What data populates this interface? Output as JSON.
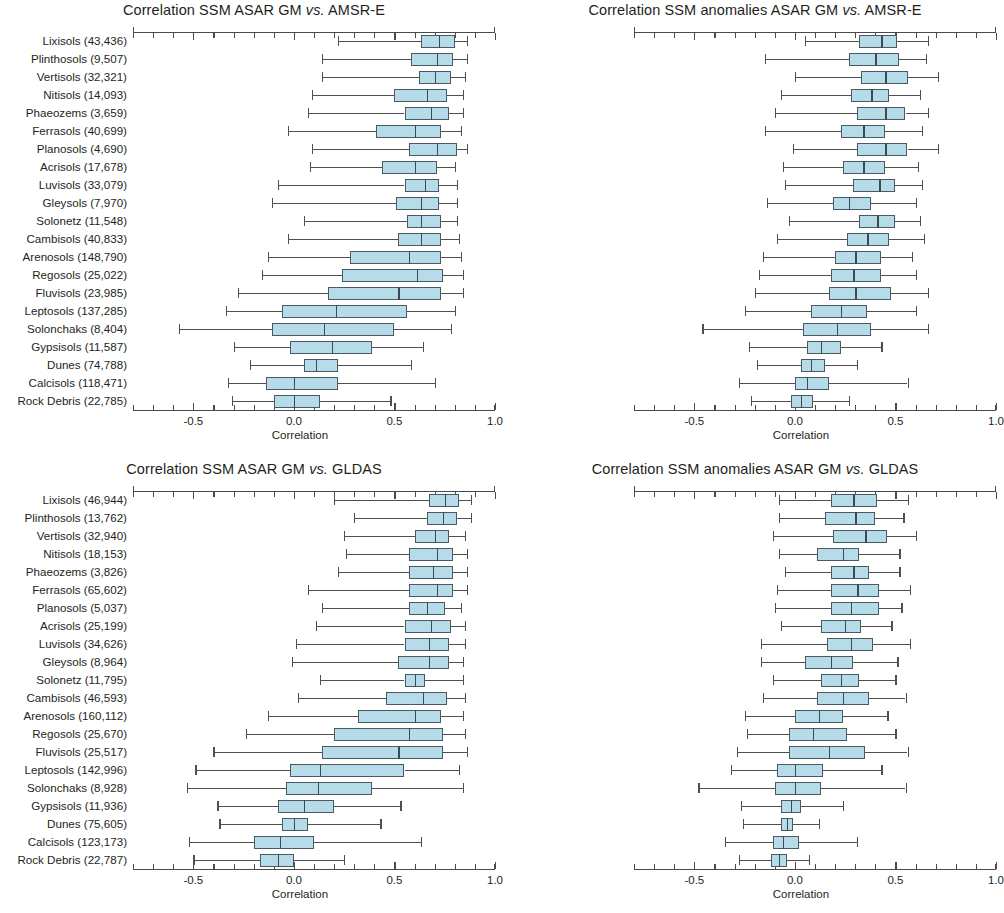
{
  "figure": {
    "width": 996,
    "height": 913,
    "box_fill_color": "#b6dcea",
    "box_line_color": "#4a5a63",
    "whisker_color": "#4f4f4f",
    "axis_color": "#4a4a4a",
    "text_color": "#231f20"
  },
  "axis": {
    "xlabel": "Correlation",
    "xlim": [
      -0.8,
      1.0
    ],
    "tick_labels": [
      "-0.5",
      "0.0",
      "0.5",
      "1.0"
    ],
    "tick_values": [
      -0.5,
      0.0,
      0.5,
      1.0
    ],
    "minor_tick_step": 0.1
  },
  "chart_data": [
    {
      "type": "box",
      "panel": "top-left",
      "title_parts": {
        "pre": "Correlation SSM ASAR GM ",
        "italic": "vs.",
        "post": " AMSR-E"
      },
      "title": "Correlation SSM ASAR GM vs. AMSR-E",
      "xlabel": "Correlation",
      "ylabel": "",
      "xlim": [
        -0.8,
        1.0
      ],
      "grid": false,
      "legend": "none",
      "categories": [
        "Lixisols (43,436)",
        "Plinthosols (9,507)",
        "Vertisols (32,321)",
        "Nitisols (14,093)",
        "Phaeozems (3,659)",
        "Ferrasols (40,699)",
        "Planosols (4,690)",
        "Acrisols (17,678)",
        "Luvisols (33,079)",
        "Gleysols (7,970)",
        "Solonetz (11,548)",
        "Cambisols (40,833)",
        "Arenosols (148,790)",
        "Regosols (25,022)",
        "Fluvisols (23,985)",
        "Leptosols (137,285)",
        "Solonchaks (8,404)",
        "Gypsisols (11,587)",
        "Dunes (74,788)",
        "Calcisols (118,471)",
        "Rock Debris (22,785)"
      ],
      "boxes": [
        {
          "low": 0.22,
          "q1": 0.63,
          "med": 0.72,
          "q3": 0.8,
          "high": 0.86
        },
        {
          "low": 0.14,
          "q1": 0.58,
          "med": 0.71,
          "q3": 0.79,
          "high": 0.86
        },
        {
          "low": 0.14,
          "q1": 0.62,
          "med": 0.7,
          "q3": 0.78,
          "high": 0.85
        },
        {
          "low": 0.09,
          "q1": 0.5,
          "med": 0.66,
          "q3": 0.76,
          "high": 0.84
        },
        {
          "low": 0.07,
          "q1": 0.55,
          "med": 0.68,
          "q3": 0.77,
          "high": 0.84
        },
        {
          "low": -0.03,
          "q1": 0.41,
          "med": 0.6,
          "q3": 0.73,
          "high": 0.83
        },
        {
          "low": 0.09,
          "q1": 0.57,
          "med": 0.71,
          "q3": 0.81,
          "high": 0.86
        },
        {
          "low": 0.08,
          "q1": 0.44,
          "med": 0.6,
          "q3": 0.71,
          "high": 0.8
        },
        {
          "low": -0.08,
          "q1": 0.55,
          "med": 0.65,
          "q3": 0.72,
          "high": 0.81
        },
        {
          "low": -0.11,
          "q1": 0.51,
          "med": 0.63,
          "q3": 0.72,
          "high": 0.81
        },
        {
          "low": 0.05,
          "q1": 0.56,
          "med": 0.63,
          "q3": 0.73,
          "high": 0.81
        },
        {
          "low": -0.03,
          "q1": 0.52,
          "med": 0.63,
          "q3": 0.73,
          "high": 0.82
        },
        {
          "low": -0.13,
          "q1": 0.28,
          "med": 0.57,
          "q3": 0.73,
          "high": 0.83
        },
        {
          "low": -0.16,
          "q1": 0.24,
          "med": 0.61,
          "q3": 0.74,
          "high": 0.84
        },
        {
          "low": -0.28,
          "q1": 0.17,
          "med": 0.52,
          "q3": 0.73,
          "high": 0.84
        },
        {
          "low": -0.34,
          "q1": -0.06,
          "med": 0.21,
          "q3": 0.56,
          "high": 0.8
        },
        {
          "low": -0.57,
          "q1": -0.11,
          "med": 0.15,
          "q3": 0.5,
          "high": 0.78
        },
        {
          "low": -0.3,
          "q1": -0.02,
          "med": 0.19,
          "q3": 0.39,
          "high": 0.64
        },
        {
          "low": -0.22,
          "q1": 0.05,
          "med": 0.11,
          "q3": 0.22,
          "high": 0.58
        },
        {
          "low": -0.33,
          "q1": -0.14,
          "med": 0.0,
          "q3": 0.22,
          "high": 0.7
        },
        {
          "low": -0.31,
          "q1": -0.1,
          "med": 0.0,
          "q3": 0.13,
          "high": 0.48
        }
      ]
    },
    {
      "type": "box",
      "panel": "top-right",
      "title_parts": {
        "pre": "Correlation SSM anomalies ASAR GM ",
        "italic": "vs.",
        "post": " AMSR-E"
      },
      "title": "Correlation SSM anomalies ASAR GM vs. AMSR-E",
      "xlabel": "Correlation",
      "ylabel": "",
      "xlim": [
        -0.8,
        1.0
      ],
      "grid": false,
      "legend": "none",
      "categories": [
        "Lixisols (43,436)",
        "Plinthosols (9,507)",
        "Vertisols (32,321)",
        "Nitisols (14,093)",
        "Phaeozems (3,659)",
        "Ferrasols (40,699)",
        "Planosols (4,690)",
        "Acrisols (17,678)",
        "Luvisols (33,079)",
        "Gleysols (7,970)",
        "Solonetz (11,548)",
        "Cambisols (40,833)",
        "Arenosols (148,790)",
        "Regosols (25,022)",
        "Fluvisols (23,985)",
        "Leptosols (137,285)",
        "Solonchaks (8,404)",
        "Gypsisols (11,587)",
        "Dunes (74,788)",
        "Calcisols (118,471)",
        "Rock Debris (22,785)"
      ],
      "boxes": [
        {
          "low": 0.05,
          "q1": 0.32,
          "med": 0.43,
          "q3": 0.51,
          "high": 0.66
        },
        {
          "low": -0.15,
          "q1": 0.27,
          "med": 0.4,
          "q3": 0.52,
          "high": 0.65
        },
        {
          "low": 0.0,
          "q1": 0.33,
          "med": 0.45,
          "q3": 0.56,
          "high": 0.71
        },
        {
          "low": -0.07,
          "q1": 0.28,
          "med": 0.38,
          "q3": 0.47,
          "high": 0.62
        },
        {
          "low": -0.1,
          "q1": 0.31,
          "med": 0.45,
          "q3": 0.55,
          "high": 0.66
        },
        {
          "low": -0.15,
          "q1": 0.23,
          "med": 0.34,
          "q3": 0.45,
          "high": 0.63
        },
        {
          "low": -0.01,
          "q1": 0.31,
          "med": 0.45,
          "q3": 0.56,
          "high": 0.71
        },
        {
          "low": -0.06,
          "q1": 0.24,
          "med": 0.34,
          "q3": 0.45,
          "high": 0.61
        },
        {
          "low": -0.05,
          "q1": 0.29,
          "med": 0.42,
          "q3": 0.5,
          "high": 0.63
        },
        {
          "low": -0.14,
          "q1": 0.19,
          "med": 0.27,
          "q3": 0.38,
          "high": 0.6
        },
        {
          "low": -0.03,
          "q1": 0.32,
          "med": 0.41,
          "q3": 0.5,
          "high": 0.62
        },
        {
          "low": -0.09,
          "q1": 0.26,
          "med": 0.36,
          "q3": 0.47,
          "high": 0.64
        },
        {
          "low": -0.16,
          "q1": 0.2,
          "med": 0.3,
          "q3": 0.43,
          "high": 0.58
        },
        {
          "low": -0.18,
          "q1": 0.18,
          "med": 0.29,
          "q3": 0.43,
          "high": 0.6
        },
        {
          "low": -0.2,
          "q1": 0.17,
          "med": 0.3,
          "q3": 0.48,
          "high": 0.66
        },
        {
          "low": -0.25,
          "q1": 0.08,
          "med": 0.23,
          "q3": 0.36,
          "high": 0.6
        },
        {
          "low": -0.46,
          "q1": 0.04,
          "med": 0.21,
          "q3": 0.38,
          "high": 0.66
        },
        {
          "low": -0.23,
          "q1": 0.06,
          "med": 0.13,
          "q3": 0.23,
          "high": 0.43
        },
        {
          "low": -0.19,
          "q1": 0.03,
          "med": 0.08,
          "q3": 0.15,
          "high": 0.31
        },
        {
          "low": -0.28,
          "q1": 0.0,
          "med": 0.06,
          "q3": 0.17,
          "high": 0.56
        },
        {
          "low": -0.22,
          "q1": -0.02,
          "med": 0.03,
          "q3": 0.09,
          "high": 0.27
        }
      ]
    },
    {
      "type": "box",
      "panel": "bottom-left",
      "title_parts": {
        "pre": "Correlation SSM ASAR GM ",
        "italic": "vs.",
        "post": " GLDAS"
      },
      "title": "Correlation SSM ASAR GM vs. GLDAS",
      "xlabel": "Correlation",
      "ylabel": "",
      "xlim": [
        -0.8,
        1.0
      ],
      "grid": false,
      "legend": "none",
      "categories": [
        "Lixisols (46,944)",
        "Plinthosols (13,762)",
        "Vertisols (32,940)",
        "Nitisols (18,153)",
        "Phaeozems (3,826)",
        "Ferrasols (65,602)",
        "Planosols (5,037)",
        "Acrisols (25,199)",
        "Luvisols (34,626)",
        "Gleysols (8,964)",
        "Solonetz (11,795)",
        "Cambisols (46,593)",
        "Arenosols (160,112)",
        "Regosols (25,670)",
        "Fluvisols (25,517)",
        "Leptosols (142,996)",
        "Solonchaks (8,928)",
        "Gypsisols (11,936)",
        "Dunes (75,605)",
        "Calcisols (123,173)",
        "Rock Debris (22,787)"
      ],
      "boxes": [
        {
          "low": 0.2,
          "q1": 0.67,
          "med": 0.75,
          "q3": 0.82,
          "high": 0.88
        },
        {
          "low": 0.3,
          "q1": 0.66,
          "med": 0.74,
          "q3": 0.81,
          "high": 0.88
        },
        {
          "low": 0.25,
          "q1": 0.6,
          "med": 0.7,
          "q3": 0.77,
          "high": 0.85
        },
        {
          "low": 0.26,
          "q1": 0.57,
          "med": 0.71,
          "q3": 0.79,
          "high": 0.86
        },
        {
          "low": 0.22,
          "q1": 0.57,
          "med": 0.69,
          "q3": 0.79,
          "high": 0.86
        },
        {
          "low": 0.07,
          "q1": 0.57,
          "med": 0.71,
          "q3": 0.79,
          "high": 0.86
        },
        {
          "low": 0.14,
          "q1": 0.57,
          "med": 0.66,
          "q3": 0.75,
          "high": 0.83
        },
        {
          "low": 0.11,
          "q1": 0.55,
          "med": 0.68,
          "q3": 0.78,
          "high": 0.85
        },
        {
          "low": 0.01,
          "q1": 0.55,
          "med": 0.67,
          "q3": 0.77,
          "high": 0.85
        },
        {
          "low": -0.01,
          "q1": 0.52,
          "med": 0.67,
          "q3": 0.77,
          "high": 0.84
        },
        {
          "low": 0.13,
          "q1": 0.55,
          "med": 0.6,
          "q3": 0.65,
          "high": 0.84
        },
        {
          "low": 0.02,
          "q1": 0.46,
          "med": 0.64,
          "q3": 0.76,
          "high": 0.85
        },
        {
          "low": -0.13,
          "q1": 0.32,
          "med": 0.6,
          "q3": 0.73,
          "high": 0.84
        },
        {
          "low": -0.24,
          "q1": 0.2,
          "med": 0.57,
          "q3": 0.74,
          "high": 0.85
        },
        {
          "low": -0.4,
          "q1": 0.14,
          "med": 0.52,
          "q3": 0.74,
          "high": 0.86
        },
        {
          "low": -0.49,
          "q1": -0.02,
          "med": 0.13,
          "q3": 0.55,
          "high": 0.82
        },
        {
          "low": -0.53,
          "q1": -0.04,
          "med": 0.12,
          "q3": 0.39,
          "high": 0.84
        },
        {
          "low": -0.38,
          "q1": -0.08,
          "med": 0.05,
          "q3": 0.2,
          "high": 0.53
        },
        {
          "low": -0.37,
          "q1": -0.06,
          "med": 0.0,
          "q3": 0.07,
          "high": 0.43
        },
        {
          "low": -0.52,
          "q1": -0.2,
          "med": -0.07,
          "q3": 0.1,
          "high": 0.63
        },
        {
          "low": -0.5,
          "q1": -0.17,
          "med": -0.08,
          "q3": 0.0,
          "high": 0.25
        }
      ]
    },
    {
      "type": "box",
      "panel": "bottom-right",
      "title_parts": {
        "pre": "Correlation SSM anomalies ASAR GM ",
        "italic": "vs.",
        "post": " GLDAS"
      },
      "title": "Correlation SSM anomalies ASAR GM vs. GLDAS",
      "xlabel": "Correlation",
      "ylabel": "",
      "xlim": [
        -0.8,
        1.0
      ],
      "grid": false,
      "legend": "none",
      "categories": [
        "Lixisols (46,944)",
        "Plinthosols (13,762)",
        "Vertisols (32,940)",
        "Nitisols (18,153)",
        "Phaeozems (3,826)",
        "Ferrasols (65,602)",
        "Planosols (5,037)",
        "Acrisols (25,199)",
        "Luvisols (34,626)",
        "Gleysols (8,964)",
        "Solonetz (11,795)",
        "Cambisols (46,593)",
        "Arenosols (160,112)",
        "Regosols (25,670)",
        "Fluvisols (25,517)",
        "Leptosols (142,996)",
        "Solonchaks (8,928)",
        "Gypsisols (11,936)",
        "Dunes (75,605)",
        "Calcisols (123,173)",
        "Rock Debris (22,787)"
      ],
      "boxes": [
        {
          "low": -0.08,
          "q1": 0.18,
          "med": 0.29,
          "q3": 0.41,
          "high": 0.56
        },
        {
          "low": -0.08,
          "q1": 0.15,
          "med": 0.3,
          "q3": 0.4,
          "high": 0.54
        },
        {
          "low": -0.11,
          "q1": 0.19,
          "med": 0.35,
          "q3": 0.46,
          "high": 0.6
        },
        {
          "low": -0.08,
          "q1": 0.11,
          "med": 0.24,
          "q3": 0.32,
          "high": 0.52
        },
        {
          "low": -0.05,
          "q1": 0.18,
          "med": 0.29,
          "q3": 0.37,
          "high": 0.52
        },
        {
          "low": -0.09,
          "q1": 0.18,
          "med": 0.31,
          "q3": 0.42,
          "high": 0.57
        },
        {
          "low": -0.1,
          "q1": 0.18,
          "med": 0.28,
          "q3": 0.42,
          "high": 0.53
        },
        {
          "low": -0.07,
          "q1": 0.13,
          "med": 0.25,
          "q3": 0.33,
          "high": 0.48
        },
        {
          "low": -0.17,
          "q1": 0.16,
          "med": 0.28,
          "q3": 0.39,
          "high": 0.57
        },
        {
          "low": -0.17,
          "q1": 0.05,
          "med": 0.18,
          "q3": 0.29,
          "high": 0.51
        },
        {
          "low": -0.11,
          "q1": 0.13,
          "med": 0.23,
          "q3": 0.32,
          "high": 0.5
        },
        {
          "low": -0.16,
          "q1": 0.11,
          "med": 0.24,
          "q3": 0.37,
          "high": 0.55
        },
        {
          "low": -0.25,
          "q1": 0.0,
          "med": 0.12,
          "q3": 0.24,
          "high": 0.46
        },
        {
          "low": -0.24,
          "q1": -0.03,
          "med": 0.09,
          "q3": 0.26,
          "high": 0.5
        },
        {
          "low": -0.29,
          "q1": -0.03,
          "med": 0.17,
          "q3": 0.35,
          "high": 0.56
        },
        {
          "low": -0.32,
          "q1": -0.09,
          "med": 0.0,
          "q3": 0.14,
          "high": 0.43
        },
        {
          "low": -0.48,
          "q1": -0.1,
          "med": 0.0,
          "q3": 0.13,
          "high": 0.55
        },
        {
          "low": -0.27,
          "q1": -0.07,
          "med": -0.02,
          "q3": 0.03,
          "high": 0.24
        },
        {
          "low": -0.26,
          "q1": -0.07,
          "med": -0.04,
          "q3": -0.01,
          "high": 0.12
        },
        {
          "low": -0.35,
          "q1": -0.11,
          "med": -0.06,
          "q3": 0.02,
          "high": 0.31
        },
        {
          "low": -0.28,
          "q1": -0.12,
          "med": -0.08,
          "q3": -0.04,
          "high": 0.07
        }
      ]
    }
  ]
}
